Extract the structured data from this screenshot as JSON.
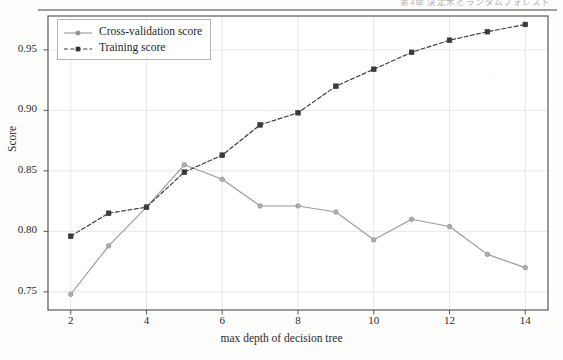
{
  "page": {
    "header_text": "第4章  決定木とランダムフォレスト",
    "background_color": "#fdfdfc"
  },
  "chart_data": {
    "type": "line",
    "title": "",
    "xlabel": "max depth of decision tree",
    "ylabel": "Score",
    "x": [
      2,
      3,
      4,
      5,
      6,
      7,
      8,
      9,
      10,
      11,
      12,
      13,
      14
    ],
    "xlim": [
      1.4,
      14.6
    ],
    "ylim": [
      0.735,
      0.978
    ],
    "xticks": [
      2,
      4,
      6,
      8,
      10,
      12,
      14
    ],
    "xtick_labels": [
      "2",
      "4",
      "6",
      "8",
      "10",
      "12",
      "14"
    ],
    "yticks": [
      0.75,
      0.8,
      0.85,
      0.9,
      0.95
    ],
    "ytick_labels": [
      "0.75",
      "0.80",
      "0.85",
      "0.90",
      "0.95"
    ],
    "grid": true,
    "legend_position": "upper left",
    "series": [
      {
        "name": "Cross-validation score",
        "values": [
          0.748,
          0.788,
          0.82,
          0.855,
          0.843,
          0.821,
          0.821,
          0.816,
          0.793,
          0.81,
          0.804,
          0.781,
          0.77
        ],
        "color": "#9a9a9a",
        "line_style": "solid",
        "marker": "circle"
      },
      {
        "name": "Training score",
        "values": [
          0.796,
          0.815,
          0.82,
          0.849,
          0.863,
          0.888,
          0.898,
          0.92,
          0.934,
          0.948,
          0.958,
          0.965,
          0.971
        ],
        "color": "#3a3a3a",
        "line_style": "dashed",
        "marker": "square"
      }
    ]
  }
}
